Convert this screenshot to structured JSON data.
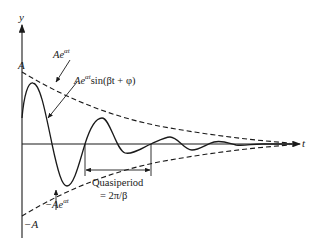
{
  "figure": {
    "axes": {
      "y_label": "y",
      "x_label": "t"
    },
    "labels": {
      "amplitude_pos": "A",
      "amplitude_neg": "−A",
      "envelope_upper_base": "Ae",
      "envelope_upper_exp": "αt",
      "envelope_lower_base": "−Ae",
      "envelope_lower_exp": "αt",
      "curve_base": "Ae",
      "curve_exp": "αt",
      "curve_tail": "sin(βt + φ)",
      "quasiperiod_line1": "Quasiperiod",
      "quasiperiod_line2": "= 2π/β"
    },
    "colors": {
      "stroke": "#1a1a1a",
      "background": "#ffffff"
    }
  }
}
